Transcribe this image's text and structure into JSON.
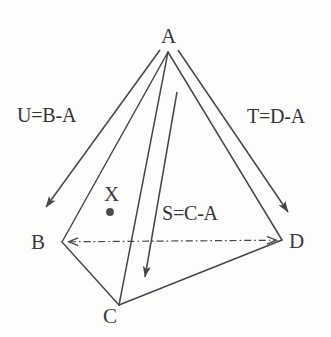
{
  "figure": {
    "background_color": "#fdfdfb",
    "stroke_color": "#46464a",
    "text_color": "#3a3a3c",
    "point_color": "#4a4a4d"
  },
  "vertices": {
    "a": "A",
    "b": "B",
    "c": "C",
    "d": "D",
    "x": "X"
  },
  "vectors": {
    "u": "U=B-A",
    "t": "T=D-A",
    "s": "S=C-A"
  },
  "geometry": {
    "apex": {
      "x": 168,
      "y": 52
    },
    "b": {
      "x": 62,
      "y": 242
    },
    "c": {
      "x": 119,
      "y": 305
    },
    "d": {
      "x": 282,
      "y": 240
    },
    "x_point": {
      "x": 110,
      "y": 212
    },
    "u_arrow": {
      "x1": 160,
      "y1": 50,
      "x2": 46,
      "y2": 207
    },
    "t_arrow": {
      "x1": 178,
      "y1": 50,
      "x2": 288,
      "y2": 212
    },
    "s_arrow": {
      "x1": 177,
      "y1": 92,
      "x2": 145,
      "y2": 277
    },
    "bd_line": {
      "x1": 62,
      "y1": 242,
      "x2": 283,
      "y2": 240
    }
  }
}
